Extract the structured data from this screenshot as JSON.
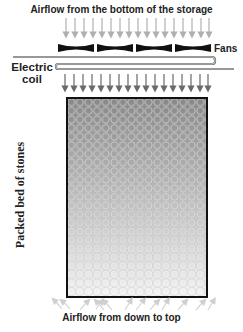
{
  "diagram": {
    "top_label": "Airflow from the bottom of the storage",
    "fans_label": "Fans",
    "coil_label_line1": "Electric",
    "coil_label_line2": "coil",
    "bed_label": "Packed bed of stones",
    "bottom_label": "Airflow from down to top",
    "components": [
      {
        "name": "Inlet airflow arrows",
        "count": 17,
        "direction": "down"
      },
      {
        "name": "Fans",
        "count": 4,
        "shape": "bow-tie"
      },
      {
        "name": "Electric coil",
        "shape": "serpentine"
      },
      {
        "name": "Outlet airflow arrows",
        "count": 17,
        "direction": "down"
      },
      {
        "name": "Packed bed of stones",
        "shape": "rectangle filled with circles",
        "gradient": "dark top to light bottom"
      },
      {
        "name": "Bottom airflow arrows",
        "direction": "up / diverging"
      }
    ],
    "colors": {
      "inlet_arrow": "#b0b0b0",
      "outlet_arrow": "#6a6a6a",
      "fan": "#111111",
      "coil": "#6e6e6e",
      "bed_top": "#888888",
      "bed_bottom": "#f4f4f4",
      "bed_border": "#111111",
      "bottom_arrow": "#d4d4d4"
    }
  }
}
